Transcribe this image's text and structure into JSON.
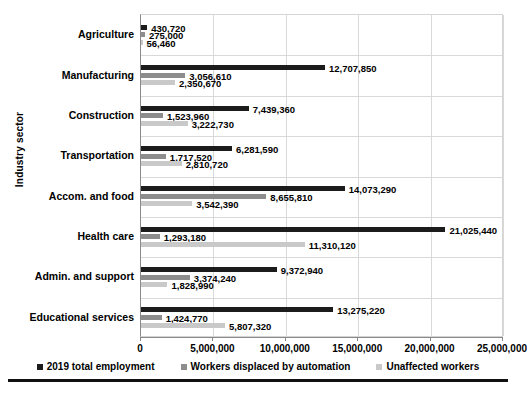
{
  "chart_data": {
    "type": "bar",
    "orientation": "horizontal",
    "title": "",
    "xlabel": "",
    "ylabel": "Industry sector",
    "xlim": [
      0,
      25000000
    ],
    "grid": true,
    "legend_position": "bottom",
    "xticks": [
      0,
      5000000,
      10000000,
      15000000,
      20000000,
      25000000
    ],
    "xtick_labels": [
      "0",
      "5,000,000",
      "10,000,000",
      "15,000,000",
      "20,000,000",
      "25,000,000"
    ],
    "categories": [
      "Agriculture",
      "Manufacturing",
      "Construction",
      "Transportation",
      "Accom. and food",
      "Health care",
      "Admin. and support",
      "Educational services"
    ],
    "series": [
      {
        "name": "2019 total employment",
        "color": "#1c1c1c",
        "values": [
          430720,
          12707850,
          7439360,
          6281590,
          14073290,
          21025440,
          9372940,
          13275220
        ],
        "labels": [
          "430,720",
          "12,707,850",
          "7,439,360",
          "6,281,590",
          "14,073,290",
          "21,025,440",
          "9,372,940",
          "13,275,220"
        ]
      },
      {
        "name": "Workers displaced by automation",
        "color": "#8d8d8d",
        "values": [
          275000,
          3056610,
          1523960,
          1717520,
          8655810,
          1293180,
          3374240,
          1424770
        ],
        "labels": [
          "275,000",
          "3,056,610",
          "1,523,960",
          "1,717,520",
          "8,655,810",
          "1,293,180",
          "3,374,240",
          "1,424,770"
        ]
      },
      {
        "name": "Unaffected workers",
        "color": "#c9c9c9",
        "values": [
          56460,
          2350670,
          3222730,
          2810720,
          3542390,
          11310120,
          1828990,
          5807320
        ],
        "labels": [
          "56,460",
          "2,350,670",
          "3,222,730",
          "2,810,720",
          "3,542,390",
          "11,310,120",
          "1,828,990",
          "5,807,320"
        ]
      }
    ]
  }
}
